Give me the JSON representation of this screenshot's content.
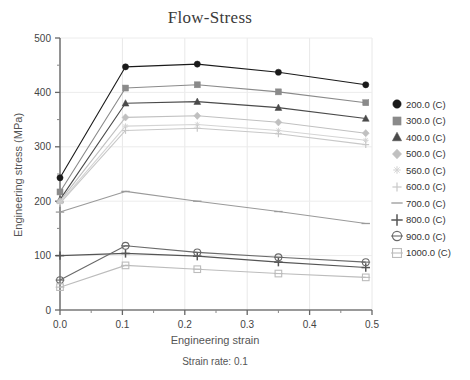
{
  "chart_data": {
    "type": "line",
    "title": "Flow-Stress",
    "subtitle": "Strain rate: 0.1",
    "xlabel": "Engineering strain",
    "ylabel": "Engineering stress (MPa)",
    "xlim": [
      0.0,
      0.5
    ],
    "ylim": [
      0,
      500
    ],
    "x_major_ticks": [
      "0.0",
      "0.1",
      "0.2",
      "0.3",
      "0.4",
      "0.5"
    ],
    "x_major_values": [
      0.0,
      0.1,
      0.2,
      0.3,
      0.4,
      0.5
    ],
    "x_minor_values": [
      0.05,
      0.15,
      0.25,
      0.35,
      0.45
    ],
    "y_major_ticks": [
      "0",
      "100",
      "200",
      "300",
      "400",
      "500"
    ],
    "y_major_values": [
      0,
      100,
      200,
      300,
      400,
      500
    ],
    "y_minor_values": [
      50,
      150,
      250,
      350,
      450
    ],
    "grid": true,
    "legend_position": "right",
    "x": [
      0.0,
      0.105,
      0.22,
      0.35,
      0.49
    ],
    "series": [
      {
        "name": "200.0 (C)",
        "label": "200.0 (C)",
        "marker": "filled-circle",
        "color": "#1a1a1a",
        "values": [
          243,
          447,
          452,
          437,
          414
        ]
      },
      {
        "name": "300.0 (C)",
        "label": "300.0 (C)",
        "marker": "filled-square",
        "color": "#8a8a8a",
        "values": [
          217,
          408,
          414,
          401,
          381
        ]
      },
      {
        "name": "400.0 (C)",
        "label": "400.0 (C)",
        "marker": "filled-triangle",
        "color": "#4a4a4a",
        "values": [
          203,
          380,
          383,
          372,
          352
        ]
      },
      {
        "name": "500.0 (C)",
        "label": "500.0 (C)",
        "marker": "diamond",
        "color": "#c0c0c0",
        "values": [
          200,
          354,
          357,
          345,
          325
        ]
      },
      {
        "name": "560.0 (C)",
        "label": "560.0 (C)",
        "marker": "small-star",
        "color": "#d4d4d4",
        "values": [
          198,
          338,
          341,
          330,
          312
        ]
      },
      {
        "name": "600.0 (C)",
        "label": "600.0 (C)",
        "marker": "plus",
        "color": "#c8c8c8",
        "values": [
          196,
          330,
          334,
          324,
          304
        ]
      },
      {
        "name": "700.0 (C)",
        "label": "700.0 (C)",
        "marker": "dash",
        "color": "#9a9a9a",
        "values": [
          180,
          218,
          200,
          181,
          159
        ]
      },
      {
        "name": "800.0 (C)",
        "label": "800.0 (C)",
        "marker": "big-plus",
        "color": "#555555",
        "values": [
          100,
          104,
          99,
          88,
          78
        ]
      },
      {
        "name": "900.0 (C)",
        "label": "900.0 (C)",
        "marker": "circle-dash",
        "color": "#6a6a6a",
        "values": [
          55,
          118,
          106,
          97,
          88
        ]
      },
      {
        "name": "1000.0 (C)",
        "label": "1000.0 (C)",
        "marker": "square-dash",
        "color": "#bcbcbc",
        "values": [
          42,
          82,
          75,
          67,
          60
        ]
      }
    ]
  }
}
